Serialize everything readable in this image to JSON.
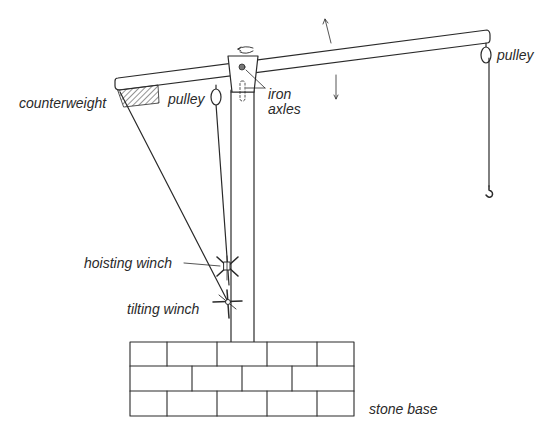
{
  "diagram": {
    "colors": {
      "line": "#2a2a2a",
      "background": "#ffffff"
    },
    "labels": {
      "counterweight": "counterweight",
      "pulley_left": "pulley",
      "pulley_right": "pulley",
      "iron_axles_line1": "iron",
      "iron_axles_line2": "axles",
      "hoisting_winch": "hoisting winch",
      "tilting_winch": "tilting winch",
      "stone_base": "stone base"
    },
    "components": [
      "beam",
      "mast",
      "mast-cap",
      "iron-axles",
      "counterweight",
      "left-pulley",
      "right-pulley",
      "hoist-rope",
      "hook",
      "stay-rope",
      "hoisting-winch",
      "tilting-winch",
      "stone-base",
      "tilt-up-arrow",
      "tilt-down-arrow",
      "rotation-arrow"
    ]
  }
}
